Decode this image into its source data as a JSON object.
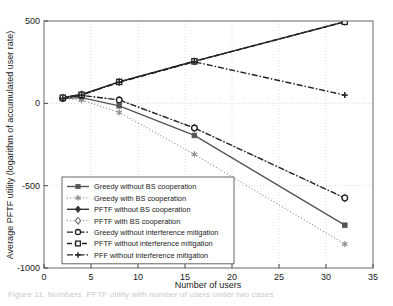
{
  "figure": {
    "caption": "Figure 11. Numbers. PFTF utility with number of users under two cases"
  },
  "chart_data": {
    "type": "line",
    "title": "",
    "xlabel": "Number of users",
    "ylabel": "Average PFTF utility (logarithm of accumulated user rate)",
    "xlim": [
      0,
      35
    ],
    "ylim": [
      -1000,
      500
    ],
    "xticks": [
      0,
      5,
      10,
      15,
      20,
      25,
      30,
      35
    ],
    "yticks": [
      -1000,
      -500,
      0,
      500
    ],
    "grid": true,
    "legend_position": "lower-left-inside",
    "x": [
      2,
      4,
      8,
      16,
      32
    ],
    "series": [
      {
        "name": "Greedy without BS cooperation",
        "values": [
          30,
          35,
          -15,
          -195,
          -740
        ],
        "marker": "square-filled",
        "line": "solid",
        "color": "#555555"
      },
      {
        "name": "Greedy with BS cooperation",
        "values": [
          28,
          20,
          -55,
          -310,
          -855
        ],
        "marker": "asterisk",
        "line": "dotted",
        "color": "#8d8d8d"
      },
      {
        "name": "PFTF without BS cooperation",
        "values": [
          35,
          55,
          130,
          255,
          495
        ],
        "marker": "diamond-filled",
        "line": "solid",
        "color": "#333333"
      },
      {
        "name": "PFTF with BS cooperation",
        "values": [
          32,
          50,
          20,
          -150,
          -575
        ],
        "marker": "diamond-open",
        "line": "dotted",
        "color": "#777777"
      },
      {
        "name": "Greedy without interference mitigation",
        "values": [
          30,
          48,
          20,
          -150,
          -575
        ],
        "marker": "circle-open",
        "line": "dash-dot",
        "color": "#222222"
      },
      {
        "name": "PFTF without interference mitigation",
        "values": [
          34,
          52,
          130,
          255,
          495
        ],
        "marker": "square-open",
        "line": "dashed",
        "color": "#222222"
      },
      {
        "name": "PFF without interference mitigation",
        "values": [
          30,
          50,
          128,
          252,
          50
        ],
        "marker": "plus",
        "line": "dash-dot",
        "color": "#222222"
      }
    ]
  }
}
